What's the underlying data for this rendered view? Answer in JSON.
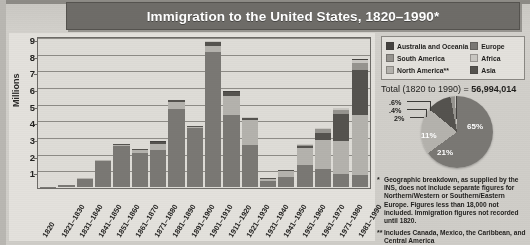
{
  "title": "Immigration to the United States, 1820–1990*",
  "axis": {
    "ylabel": "Millions",
    "yticks": [
      "9",
      "8",
      "7",
      "6",
      "5",
      "4",
      "3",
      "2",
      "1"
    ],
    "ymax": 9
  },
  "legend": {
    "column_a": [
      {
        "label": "Australia and Oceania",
        "color": "#454340",
        "key": "oceania"
      },
      {
        "label": "South America",
        "color": "#96948f",
        "key": "samer"
      },
      {
        "label": "North America**",
        "color": "#b4b2ad",
        "key": "namer"
      }
    ],
    "column_b": [
      {
        "label": "Europe",
        "color": "#7a7874",
        "key": "europe"
      },
      {
        "label": "Africa",
        "color": "#c9c7c2",
        "key": "africa"
      },
      {
        "label": "Asia",
        "color": "#55534f",
        "key": "asia"
      }
    ]
  },
  "total": {
    "prefix": "Total (1820 to 1990) = ",
    "value": "56,994,014"
  },
  "pie_labels": {
    "europe": "65%",
    "north_america": "21%",
    "asia": "11%",
    "south_america": "2%",
    "africa": ".4%",
    "oceania": ".6%"
  },
  "notes": [
    {
      "marker": "*",
      "text": "Geographic breakdown, as supplied by the INS, does not include separate figures for Northern/Western or Southern/Eastern Europe. Figures less than 18,000 not included. Immigration figures not recorded until 1820."
    },
    {
      "marker": "**",
      "text": "Includes Canada, Mexico, the Caribbean, and Central America"
    }
  ],
  "chart_data": {
    "type": "bar",
    "title": "Immigration to the United States, 1820–1990*",
    "xlabel": "",
    "ylabel": "Millions",
    "ylim": [
      0,
      9
    ],
    "grid": true,
    "legend_position": "top-right",
    "stacked": true,
    "categories": [
      "1820",
      "1821–1830",
      "1831–1840",
      "1841–1850",
      "1851–1860",
      "1861–1870",
      "1871–1880",
      "1881–1890",
      "1891–1900",
      "1901–1910",
      "1911–1920",
      "1921–1930",
      "1931–1940",
      "1941–1950",
      "1951–1960",
      "1961–1970",
      "1971–1980",
      "1981–1990"
    ],
    "series": [
      {
        "name": "Europe",
        "color": "#7a7874",
        "values": [
          0.01,
          0.1,
          0.5,
          1.55,
          2.45,
          2.05,
          2.2,
          4.7,
          3.55,
          8.1,
          4.35,
          2.5,
          0.35,
          0.62,
          1.33,
          1.1,
          0.8,
          0.7
        ]
      },
      {
        "name": "North America**",
        "color": "#b4b2ad",
        "values": [
          0.0,
          0.01,
          0.03,
          0.06,
          0.07,
          0.17,
          0.4,
          0.43,
          0.04,
          0.36,
          1.14,
          1.52,
          0.16,
          0.35,
          0.99,
          1.72,
          1.98,
          3.6
        ]
      },
      {
        "name": "Asia",
        "color": "#55534f",
        "values": [
          0.0,
          0.0,
          0.0,
          0.0,
          0.04,
          0.06,
          0.12,
          0.07,
          0.07,
          0.25,
          0.19,
          0.11,
          0.02,
          0.03,
          0.15,
          0.43,
          1.59,
          2.74
        ]
      },
      {
        "name": "South America",
        "color": "#96948f",
        "values": [
          0.0,
          0.0,
          0.0,
          0.0,
          0.0,
          0.0,
          0.01,
          0.02,
          0.01,
          0.02,
          0.04,
          0.04,
          0.01,
          0.02,
          0.08,
          0.25,
          0.28,
          0.4
        ]
      },
      {
        "name": "Africa",
        "color": "#c9c7c2",
        "values": [
          0.0,
          0.0,
          0.0,
          0.0,
          0.0,
          0.0,
          0.0,
          0.0,
          0.0,
          0.01,
          0.01,
          0.01,
          0.0,
          0.01,
          0.01,
          0.03,
          0.08,
          0.18
        ]
      },
      {
        "name": "Australia and Oceania",
        "color": "#454340",
        "values": [
          0.0,
          0.0,
          0.0,
          0.0,
          0.0,
          0.01,
          0.01,
          0.01,
          0.01,
          0.01,
          0.01,
          0.01,
          0.0,
          0.01,
          0.01,
          0.03,
          0.04,
          0.04
        ]
      }
    ],
    "pie": {
      "type": "pie",
      "title": "Total (1820 to 1990) = 56,994,014",
      "labels": [
        "Europe",
        "North America**",
        "Asia",
        "South America",
        "Africa",
        "Australia and Oceania"
      ],
      "values": [
        65,
        21,
        11,
        2,
        0.4,
        0.6
      ],
      "display_labels": [
        "65%",
        "21%",
        "11%",
        "2%",
        ".4%",
        ".6%"
      ],
      "colors": [
        "#7a7874",
        "#b4b2ad",
        "#55534f",
        "#96948f",
        "#c9c7c2",
        "#454340"
      ]
    }
  }
}
